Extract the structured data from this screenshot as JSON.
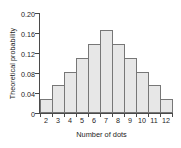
{
  "chart_data": {
    "type": "bar",
    "title": "",
    "subtitle": "",
    "xlabel": "Number of dots",
    "ylabel": "Theoretical probability",
    "categories": [
      "2",
      "3",
      "4",
      "5",
      "6",
      "7",
      "8",
      "9",
      "10",
      "11",
      "12"
    ],
    "values": [
      0.028,
      0.056,
      0.083,
      0.111,
      0.139,
      0.167,
      0.139,
      0.111,
      0.083,
      0.056,
      0.028
    ],
    "series": [
      {
        "name": "Theoretical probability",
        "values": [
          0.028,
          0.056,
          0.083,
          0.111,
          0.139,
          0.167,
          0.139,
          0.111,
          0.083,
          0.056,
          0.028
        ]
      }
    ],
    "ylim": [
      0,
      0.2
    ],
    "xlim_categories": [
      "2",
      "12"
    ],
    "yticks": [
      0,
      0.04,
      0.08,
      0.12,
      0.16,
      0.2
    ],
    "ytick_labels": [
      "0",
      "0.04",
      "0.08",
      "0.12",
      "0.16",
      "0.20"
    ],
    "xtick_labels": [
      "2",
      "3",
      "4",
      "5",
      "6",
      "7",
      "8",
      "9",
      "10",
      "11",
      "12"
    ],
    "grid": false,
    "legend": false,
    "legend_position": "none",
    "bar_fill_color": "#e7e7e7",
    "bar_edge_color": "#777777",
    "axis_color": "#4a4a4a",
    "text_color": "#1d1d1d",
    "background_color": "#ffffff"
  }
}
